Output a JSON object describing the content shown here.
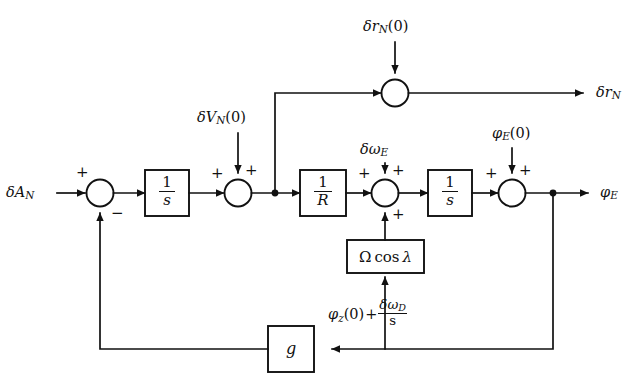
{
  "diagram": {
    "type": "control-block-diagram",
    "background_color": "#ffffff",
    "line_color": "#111111"
  },
  "inputs": {
    "delta_a_n": "δA",
    "delta_a_n_sub": "N",
    "delta_v_n_0": "δV",
    "delta_v_n_0_sub": "N",
    "delta_v_n_0_arg": "(0)",
    "delta_r_n_0": "δr",
    "delta_r_n_0_sub": "N",
    "delta_r_n_0_arg": "(0)",
    "delta_omega_e": "δω",
    "delta_omega_e_sub": "E",
    "phi_e_0": "φ",
    "phi_e_0_sub": "E",
    "phi_e_0_arg": "(0)"
  },
  "outputs": {
    "delta_r_n": "δr",
    "delta_r_n_sub": "N",
    "phi_e": "φ",
    "phi_e_sub": "E"
  },
  "blocks": [
    {
      "id": "integrator-1",
      "label": "1/s",
      "numerator": "1",
      "denominator": "s"
    },
    {
      "id": "reciprocal-radius",
      "label": "1/R",
      "numerator": "1",
      "denominator": "R"
    },
    {
      "id": "integrator-2",
      "label": "1/s",
      "numerator": "1",
      "denominator": "s"
    },
    {
      "id": "earth-rate",
      "label": "Ω cos λ",
      "omega": "Ω",
      "cos": "cos",
      "lambda": "λ"
    },
    {
      "id": "gravity-gain",
      "label": "g"
    }
  ],
  "summers": [
    {
      "id": "summer-input",
      "signs": {
        "west": "+",
        "south": "−"
      }
    },
    {
      "id": "summer-velocity",
      "signs": {
        "west": "+",
        "north": "+"
      }
    },
    {
      "id": "summer-rate",
      "signs": {
        "west": "+",
        "north": "+",
        "south": "+"
      }
    },
    {
      "id": "summer-tilt",
      "signs": {
        "west": "+",
        "north": "+"
      }
    },
    {
      "id": "summer-position",
      "signs": {
        "west": "",
        "north": ""
      }
    }
  ],
  "annotations": {
    "feedback_label_phi": "φ",
    "feedback_label_phi_sub": "z",
    "feedback_label_arg": "(0)",
    "feedback_label_plus": "+",
    "feedback_label_num": "δω",
    "feedback_label_num_sub": "D",
    "feedback_label_den": "s"
  },
  "signs": {
    "plus": "+",
    "minus": "−"
  }
}
